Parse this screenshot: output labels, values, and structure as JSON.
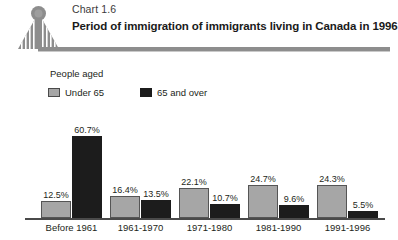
{
  "header": {
    "chart_number": "Chart 1.6",
    "title": "Period of immigration of immigrants living in Canada in 1996",
    "logo_icon": "statistics-canada-figure-icon",
    "rule_color": "#8d8d8d"
  },
  "legend": {
    "title": "People aged",
    "entries": [
      {
        "label": "Under 65",
        "color": "#a6a6a6",
        "swatch": "gray"
      },
      {
        "label": "65 and over",
        "color": "#1c1c1c",
        "swatch": "black"
      }
    ]
  },
  "chart_data": {
    "type": "bar",
    "title": "Period of immigration of immigrants living in Canada in 1996",
    "xlabel": "",
    "ylabel": "",
    "ylim": [
      0,
      65
    ],
    "grid": false,
    "legend_position": "top-left",
    "categories": [
      "Before 1961",
      "1961-1970",
      "1971-1980",
      "1981-1990",
      "1991-1996"
    ],
    "series": [
      {
        "name": "Under 65",
        "color": "#a6a6a6",
        "values": [
          12.5,
          16.4,
          22.1,
          24.7,
          24.3
        ],
        "labels": [
          "12.5%",
          "16.4%",
          "22.1%",
          "24.7%",
          "24.3%"
        ]
      },
      {
        "name": "65 and over",
        "color": "#1c1c1c",
        "values": [
          60.7,
          13.5,
          10.7,
          9.6,
          5.5
        ],
        "labels": [
          "60.7%",
          "13.5%",
          "10.7%",
          "9.6%",
          "5.5%"
        ]
      }
    ]
  }
}
